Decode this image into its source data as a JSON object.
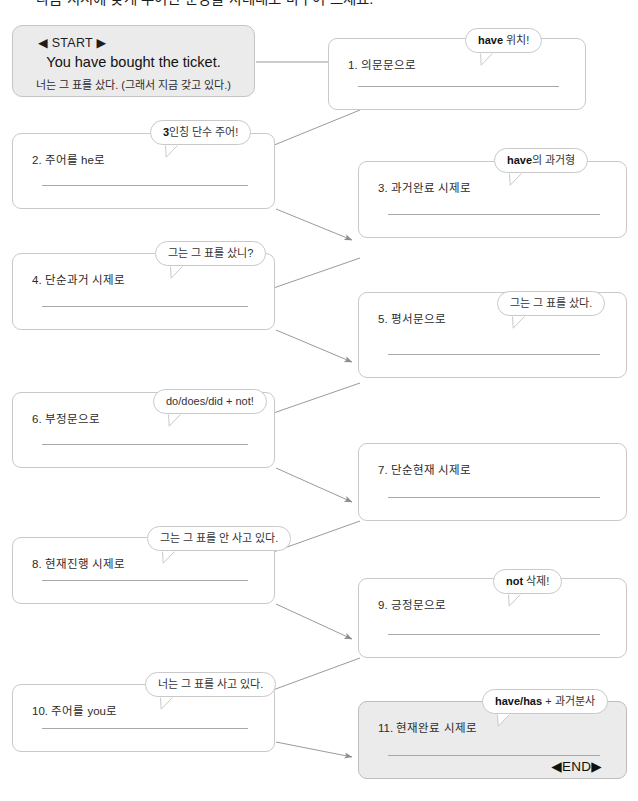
{
  "page": {
    "title": "다음 지시에 맞게 주어진 문장을 차례대로 바꾸어 쓰세요.",
    "width": 638,
    "height": 801
  },
  "colors": {
    "box_border": "#c9c9c9",
    "box_fill": "#ffffff",
    "box_fill_shaded": "#ebebeb",
    "line": "#a8a8a8",
    "connector": "#9a9a9a",
    "text": "#2b2b2b"
  },
  "start": {
    "tag": "◀ START ▶",
    "sentence_en": "You have bought the ticket.",
    "sentence_ko": "너는 그 표를 샀다. (그래서 지금 갖고 있다.)"
  },
  "end": {
    "tag": "◀END▶"
  },
  "steps": [
    {
      "number": "1.",
      "label": "1. 의문문으로",
      "column": "right",
      "hint_bold": "have",
      "hint_rest": " 위치!",
      "shaded": false,
      "answer": ""
    },
    {
      "number": "2.",
      "label": "2. 주어를 he로",
      "column": "left",
      "hint_bold": "3",
      "hint_rest": "인칭 단수 주어!",
      "shaded": false,
      "answer": ""
    },
    {
      "number": "3.",
      "label": "3. 과거완료 시제로",
      "column": "right",
      "hint_bold": "have",
      "hint_rest": "의 과거형",
      "shaded": false,
      "answer": ""
    },
    {
      "number": "4.",
      "label": "4. 단순과거 시제로",
      "column": "left",
      "hint_bold": "",
      "hint_rest": "그는 그 표를 샀니?",
      "shaded": false,
      "answer": ""
    },
    {
      "number": "5.",
      "label": "5. 평서문으로",
      "column": "right",
      "hint_bold": "",
      "hint_rest": "그는 그 표를 샀다.",
      "shaded": false,
      "answer": ""
    },
    {
      "number": "6.",
      "label": "6. 부정문으로",
      "column": "left",
      "hint_bold": "",
      "hint_rest": "do/does/did + not!",
      "shaded": false,
      "answer": ""
    },
    {
      "number": "7.",
      "label": "7. 단순현재 시제로",
      "column": "right",
      "hint_bold": "",
      "hint_rest": "",
      "shaded": false,
      "answer": ""
    },
    {
      "number": "8.",
      "label": "8. 현재진행 시제로",
      "column": "left",
      "hint_bold": "",
      "hint_rest": "그는 그 표를 안 사고 있다.",
      "shaded": false,
      "answer": ""
    },
    {
      "number": "9.",
      "label": "9. 긍정문으로",
      "column": "right",
      "hint_bold": "not",
      "hint_rest": " 삭제!",
      "shaded": false,
      "answer": ""
    },
    {
      "number": "10.",
      "label": "10. 주어를 you로",
      "column": "left",
      "hint_bold": "",
      "hint_rest": "너는 그 표를 사고 있다.",
      "shaded": false,
      "answer": ""
    },
    {
      "number": "11.",
      "label": "11. 현재완료 시제로",
      "column": "right",
      "hint_bold": "have/has",
      "hint_rest": " + 과거분사",
      "shaded": true,
      "answer": ""
    }
  ]
}
